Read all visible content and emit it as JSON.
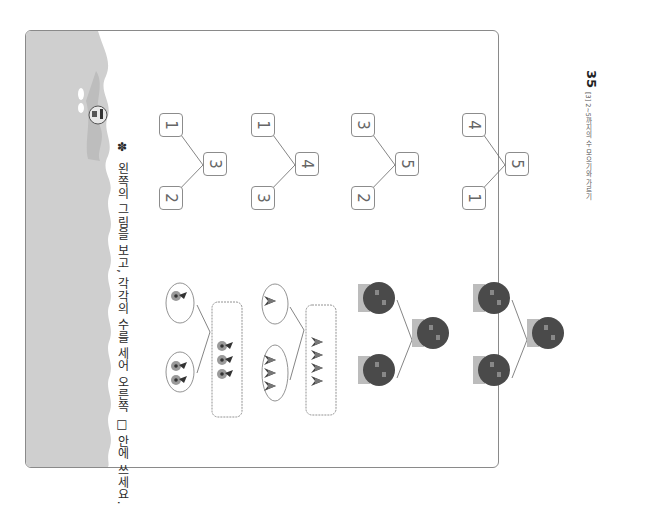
{
  "instruction": {
    "marker": "✽",
    "text": "왼쪽의 그림을 보고, 각각의 수를 세어 오른쪽 □ 안에 쓰세요."
  },
  "footer": {
    "section": "[3] 2~5까지의 수 모으기와 가르기",
    "page_number": "35"
  },
  "problems": [
    {
      "picture": "flowers",
      "left": "2",
      "right": "1",
      "total": "3",
      "group_left_count": 2,
      "group_right_count": 1
    },
    {
      "picture": "tulips",
      "left": "3",
      "right": "1",
      "total": "4",
      "group_left_count": 3,
      "group_right_count": 1
    },
    {
      "picture": "jars",
      "left": "2",
      "right": "3",
      "total": "5"
    },
    {
      "picture": "jars",
      "left": "1",
      "right": "4",
      "total": "5"
    }
  ],
  "colors": {
    "strip": "#cfcfcf",
    "strip_dark": "#bdbdbd",
    "border": "#8a8a8a",
    "box_border": "#8c8c8c",
    "digit": "#666666",
    "jar": "#4a4a4a",
    "jar_lid": "#bcbcbc"
  }
}
